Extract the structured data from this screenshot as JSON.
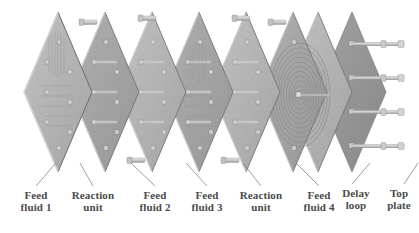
{
  "figure": {
    "kind": "exploded-isometric-assembly",
    "background_color": "#ffffff",
    "palette": {
      "plate_face_light": "#b9b9b9",
      "plate_face_mid": "#a3a3a3",
      "plate_face_dark": "#8d8d8d",
      "plate_edge": "#6f6f6f",
      "plate_rim_highlight": "#d8d8d8",
      "top_plate_face": "#9a9a9a",
      "bolt_body": "#c9c9c9",
      "bolt_shade": "#8f8f8f",
      "spiral_line": "#8a8a8a",
      "leader_line": "#7b7b7b",
      "label_text": "#4a4a4a"
    }
  },
  "labels": [
    {
      "id": "feed-fluid-1",
      "text": "Feed\nfluid 1",
      "x": 8,
      "y": 190,
      "w": 56,
      "leader": {
        "x1": 36,
        "y1": 186,
        "x2": 56,
        "y2": 163
      }
    },
    {
      "id": "reaction-unit-1",
      "text": "Reaction\nunit",
      "x": 60,
      "y": 190,
      "w": 66,
      "leader": {
        "x1": 93,
        "y1": 186,
        "x2": 80,
        "y2": 163
      }
    },
    {
      "id": "feed-fluid-2",
      "text": "Feed\nfluid 2",
      "x": 127,
      "y": 190,
      "w": 56,
      "leader": {
        "x1": 155,
        "y1": 186,
        "x2": 131,
        "y2": 163
      }
    },
    {
      "id": "feed-fluid-3",
      "text": "Feed\nfluid 3",
      "x": 179,
      "y": 190,
      "w": 56,
      "leader": {
        "x1": 207,
        "y1": 186,
        "x2": 186,
        "y2": 163
      }
    },
    {
      "id": "reaction-unit-2",
      "text": "Reaction\nunit",
      "x": 228,
      "y": 190,
      "w": 66,
      "leader": {
        "x1": 261,
        "y1": 186,
        "x2": 243,
        "y2": 163
      }
    },
    {
      "id": "feed-fluid-4",
      "text": "Feed\nfluid 4",
      "x": 291,
      "y": 190,
      "w": 56,
      "leader": {
        "x1": 319,
        "y1": 186,
        "x2": 296,
        "y2": 163
      }
    },
    {
      "id": "delay-loop",
      "text": "Delay\nloop",
      "x": 332,
      "y": 188,
      "w": 48,
      "leader": {
        "x1": 352,
        "y1": 184,
        "x2": 370,
        "y2": 163
      }
    },
    {
      "id": "top-plate",
      "text": "Top\nplate",
      "x": 384,
      "y": 188,
      "w": 44,
      "leader": {
        "x1": 404,
        "y1": 184,
        "x2": 418,
        "y2": 163
      }
    }
  ],
  "components": {
    "plates": [
      {
        "id": "plate-1",
        "role": "feed-fluid-1",
        "cx": 58,
        "cy": 92,
        "tone": "light"
      },
      {
        "id": "plate-2",
        "role": "reaction-unit-1",
        "cx": 105,
        "cy": 92,
        "tone": "mid"
      },
      {
        "id": "plate-3",
        "role": "feed-fluid-2",
        "cx": 152,
        "cy": 92,
        "tone": "light"
      },
      {
        "id": "plate-4",
        "role": "feed-fluid-3",
        "cx": 199,
        "cy": 92,
        "tone": "mid"
      },
      {
        "id": "plate-5",
        "role": "reaction-unit-2",
        "cx": 246,
        "cy": 92,
        "tone": "light"
      },
      {
        "id": "plate-6",
        "role": "feed-fluid-4",
        "cx": 293,
        "cy": 92,
        "tone": "mid"
      },
      {
        "id": "plate-7",
        "role": "delay-loop",
        "cx": 318,
        "cy": 92,
        "tone": "light"
      },
      {
        "id": "plate-8",
        "role": "top-plate",
        "cx": 352,
        "cy": 92,
        "tone": "dark"
      }
    ],
    "delay_loop": {
      "turns": 11,
      "cx": 300,
      "cy": 95,
      "rx": 30,
      "ry": 52
    },
    "tie_rods": {
      "count": 4,
      "rows_y": [
        44,
        78,
        112,
        146
      ],
      "x_start": 352,
      "x_end": 404
    },
    "inlet_nozzles": {
      "count": 6,
      "note": "small cylindrical feed fittings on plate apexes"
    },
    "bolt_hole_grid": {
      "columns": 3,
      "rows": 4,
      "marker": "square"
    }
  }
}
